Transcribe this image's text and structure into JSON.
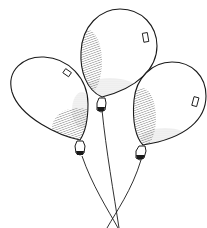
{
  "illustration": {
    "subject": "three balloons",
    "style": "black ink line art with hatched shading",
    "colors": {
      "background": "#ffffff",
      "ink": "#1a1a1a",
      "shade": "#555555"
    },
    "balloons": [
      {
        "id": "left",
        "label": "left-balloon"
      },
      {
        "id": "middle",
        "label": "middle-balloon"
      },
      {
        "id": "right",
        "label": "right-balloon"
      }
    ]
  }
}
